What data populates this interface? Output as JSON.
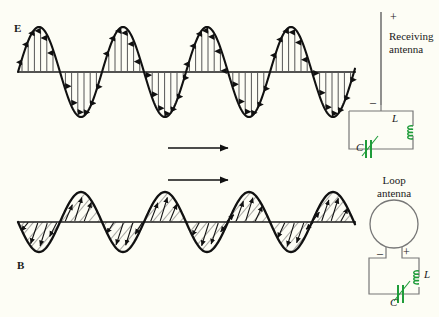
{
  "figure": {
    "background_color": "#fdfdf5",
    "ink_color": "#1a1a1a",
    "component_color": "#1f9c3a"
  },
  "labels": {
    "e_field": "E",
    "b_field": "B",
    "receiving_antenna": "Receiving\nantenna",
    "receiving_antenna_line1": "Receiving",
    "receiving_antenna_line2": "antenna",
    "loop_antenna_line1": "Loop",
    "loop_antenna_line2": "antenna",
    "inductor_top": "L",
    "capacitor_top": "C",
    "inductor_bottom": "L",
    "capacitor_bottom": "C",
    "polarity_plus_top": "+",
    "polarity_minus_top": "–",
    "polarity_minus_loop": "–",
    "polarity_plus_loop": "+"
  },
  "chart_data": {
    "type": "line",
    "xlabel": "",
    "ylabel": "",
    "grid": false,
    "legend": "none",
    "series": [
      {
        "name": "E",
        "waveform": "sine",
        "baseline_y": 72,
        "amplitude": 45,
        "wavelength": 84,
        "x_start": 18,
        "x_end": 355,
        "cycles": 4,
        "field_lines": "vertical-arrows",
        "phase_deg": 0
      },
      {
        "name": "B",
        "waveform": "sine",
        "baseline_y": 222,
        "amplitude": 30,
        "wavelength": 84,
        "x_start": 18,
        "x_end": 355,
        "cycles": 4,
        "field_lines": "diagonal-hatch-arrows",
        "phase_deg": 180
      }
    ],
    "annotations": [
      {
        "name": "propagation-arrow-upper",
        "x1": 168,
        "x2": 232,
        "y": 148,
        "direction": "right"
      },
      {
        "name": "propagation-arrow-lower",
        "x1": 168,
        "x2": 232,
        "y": 180,
        "direction": "right"
      }
    ]
  }
}
